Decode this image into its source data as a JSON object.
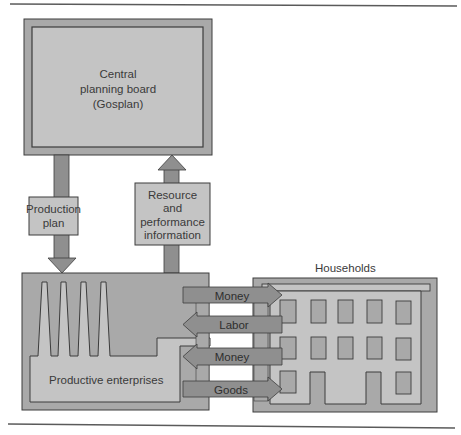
{
  "diagram": {
    "colors": {
      "background": "#ffffff",
      "light_fill": "#c4c4c4",
      "mid_fill": "#a9a9a9",
      "arrow_fill": "#8f8f8f",
      "stroke": "#3c3c3c",
      "rule": "#5a5a5a"
    },
    "nodes": {
      "gosplan": {
        "line1": "Central",
        "line2": "planning board",
        "line3": "(Gosplan)"
      },
      "production_plan": {
        "line1": "Production",
        "line2": "plan"
      },
      "resource_info": {
        "line1": "Resource",
        "line2": "and",
        "line3": "performance",
        "line4": "information"
      },
      "enterprises": {
        "label": "Productive enterprises"
      },
      "households": {
        "label": "Households"
      }
    },
    "flows": [
      {
        "label": "Money",
        "direction": "to-households"
      },
      {
        "label": "Labor",
        "direction": "to-enterprises"
      },
      {
        "label": "Money",
        "direction": "to-enterprises"
      },
      {
        "label": "Goods",
        "direction": "to-households"
      }
    ],
    "edges": [
      {
        "from": "gosplan",
        "to": "enterprises",
        "label": "Production plan"
      },
      {
        "from": "enterprises",
        "to": "gosplan",
        "label": "Resource and performance information"
      }
    ]
  }
}
